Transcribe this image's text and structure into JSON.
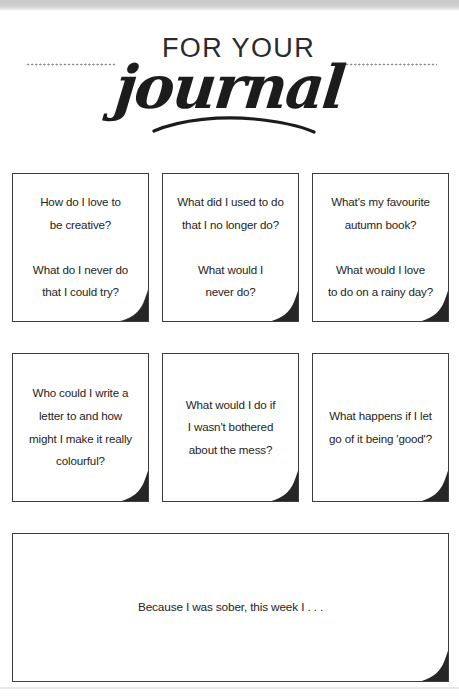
{
  "page": {
    "title_small": "FOR YOUR",
    "title_script": "journal"
  },
  "prompts": {
    "row1": [
      {
        "text": "How do I love to\nbe creative?\n\nWhat do I never do\nthat I could try?"
      },
      {
        "text": "What did I used to do\nthat I no longer do?\n\nWhat would I\nnever do?"
      },
      {
        "text": "What's my favourite\nautumn book?\n\nWhat would I love\nto do on a rainy day?"
      }
    ],
    "row2": [
      {
        "text": "Who could I write a\nletter to and how\nmight I make it really\ncolourful?"
      },
      {
        "text": "What would I do if\nI wasn't bothered\nabout the mess?"
      },
      {
        "text": "What happens if I let\ngo of it being 'good'?"
      }
    ],
    "wide": {
      "text": "Because I was sober, this week I . . ."
    }
  },
  "colors": {
    "ink": "#242424",
    "border": "#3d3d3d",
    "fold": "#262626",
    "dots": "#8d8d8d",
    "page_edge": "#c9c9c9",
    "paper": "#ffffff"
  }
}
